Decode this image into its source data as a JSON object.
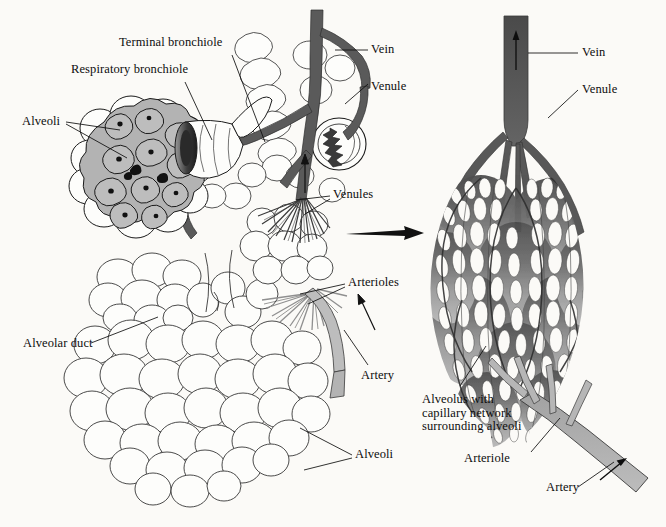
{
  "figure": {
    "background_color": "#fbfaf7",
    "ink_color": "#0d0d0d",
    "colors": {
      "vein_dark": "#595959",
      "vein_darker": "#4a4a4a",
      "venule_dark": "#585858",
      "artery_light": "#b3b3b3",
      "arteriole_light": "#bdbdbd",
      "alveoli_fill": "#b9b9b9",
      "alveoli_wall": "#e8e8e8",
      "capillary_mid": "#8a8a8a",
      "outline": "#1a1a1a"
    }
  },
  "labels": {
    "terminal_bronchiole": "Terminal bronchiole",
    "respiratory_bronchiole": "Respiratory bronchiole",
    "alveoli_left": "Alveoli",
    "vein_left": "Vein",
    "venule_left": "Venule",
    "venules": "Venules",
    "arterioles": "Arterioles",
    "artery_left": "Artery",
    "alveolar_duct": "Alveolar duct",
    "alveoli_bottom": "Alveoli",
    "vein_right": "Vein",
    "venule_right": "Venule",
    "alveolus_capillary": "Alveolus with\ncapillary network\nsurrounding alveoli",
    "arteriole_right": "Arteriole",
    "artery_right": "Artery"
  }
}
